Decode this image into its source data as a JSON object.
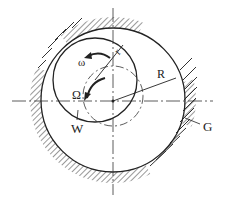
{
  "diagram": {
    "labels": {
      "omega": "ω",
      "Omega": "Ω",
      "r": "r",
      "R": "R",
      "W": "W",
      "G": "G"
    },
    "colors": {
      "stroke": "#222222",
      "background": "#ffffff"
    }
  }
}
